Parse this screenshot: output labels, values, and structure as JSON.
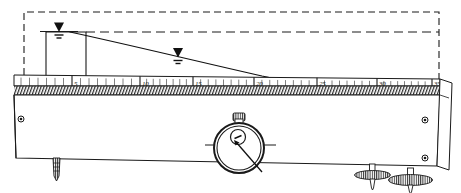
{
  "figure": {
    "name": "seepage-flume-apparatus",
    "background": "#ffffff",
    "ink": "#1a1a1a",
    "width": 461,
    "height": 193
  },
  "scale": {
    "name": "graduated-ruler",
    "ticks": [
      {
        "label": "5",
        "x": 72
      },
      {
        "label": "10",
        "x": 140
      },
      {
        "label": "15",
        "x": 193
      },
      {
        "label": "20",
        "x": 254
      },
      {
        "label": "25",
        "x": 317
      },
      {
        "label": "30",
        "x": 377
      },
      {
        "label": "35",
        "x": 432
      }
    ],
    "minor_tick_count": 7,
    "baseline_y": 86,
    "left_x": 14,
    "right_x": 440
  },
  "water": {
    "upstream_symbol": {
      "name": "water-level-symbol-upstream",
      "x": 58,
      "y": 26
    },
    "downstream_symbol": {
      "name": "water-level-symbol-downstream",
      "x": 177,
      "y": 52
    },
    "head_line_y": 32,
    "phreatic_start_x": 70,
    "phreatic_end_x": 318,
    "reservoir_left_x": 46,
    "reservoir_right_x": 86
  },
  "dashed_outline": {
    "name": "reference-datum-outline",
    "left_x": 24,
    "right_x": 439,
    "top_y": 12,
    "bottom_y": 86
  },
  "gauge": {
    "name": "dial-gauge",
    "cx": 239,
    "cy": 146,
    "outer_r": 25,
    "inner_r": 22,
    "face_r": 7,
    "stem_label": "",
    "pointer_angle_deg": 52
  },
  "feet": [
    {
      "name": "leveling-foot-left",
      "x": 56,
      "y": 160
    },
    {
      "name": "leveling-foot-center-right",
      "x": 373,
      "y": 166
    },
    {
      "name": "leveling-foot-right",
      "x": 411,
      "y": 172
    }
  ],
  "bolts": [
    {
      "name": "bolt-hole-left",
      "cx": 21,
      "cy": 119
    },
    {
      "name": "bolt-hole-right-upper",
      "cx": 425,
      "cy": 120
    },
    {
      "name": "bolt-hole-right-lower",
      "cx": 425,
      "cy": 158
    }
  ],
  "body": {
    "name": "flume-body",
    "top_y": 86,
    "bottom_left_y": 158,
    "bottom_right_y": 165,
    "left_x": 14,
    "right_x": 440,
    "hatch_band_height": 9
  }
}
